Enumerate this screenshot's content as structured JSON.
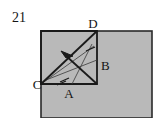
{
  "figure": {
    "problem_number": "21",
    "canvas": {
      "width": 162,
      "height": 118,
      "background": "#ffffff"
    },
    "colors": {
      "shaded_fill": "#b9b9b9",
      "outline": "#2a2a2a",
      "line": "#1a1a1a",
      "thin_line": "#3a3a3a",
      "text": "#141414"
    },
    "shaded_rectangle": {
      "name": "large-shaded-rectangle",
      "x": 41,
      "y": 31,
      "width": 111,
      "height": 87,
      "fill": "#b9b9b9",
      "stroke": "#2a2a2a",
      "stroke_width": 1.6
    },
    "square": {
      "name": "inner-square-CABD",
      "corners": {
        "C": {
          "x": 41,
          "y": 84
        },
        "bottom_right": {
          "x": 97,
          "y": 84
        },
        "D": {
          "x": 97,
          "y": 31
        },
        "top_left": {
          "x": 41,
          "y": 31
        }
      },
      "stroke": "#1a1a1a",
      "stroke_width": 1.8
    },
    "diagonal": {
      "name": "diagonal-C-to-D",
      "from": {
        "x": 41,
        "y": 84
      },
      "to": {
        "x": 97,
        "y": 31
      },
      "stroke_width": 1.8
    },
    "arrow": {
      "name": "arrow-vector-up-left",
      "from": {
        "x": 97,
        "y": 84
      },
      "to": {
        "x": 62,
        "y": 52
      },
      "head_length": 9,
      "head_width": 7,
      "stroke_width": 1.8
    },
    "thin_lines": [
      {
        "name": "thin-line-1",
        "from": {
          "x": 41,
          "y": 84
        },
        "to": {
          "x": 94,
          "y": 46
        },
        "stroke_width": 0.8
      },
      {
        "name": "thin-line-2",
        "from": {
          "x": 46,
          "y": 80
        },
        "to": {
          "x": 97,
          "y": 60
        },
        "stroke_width": 0.8
      },
      {
        "name": "thin-line-3",
        "from": {
          "x": 72,
          "y": 84
        },
        "to": {
          "x": 92,
          "y": 44
        },
        "stroke_width": 0.8
      }
    ],
    "tick_marks": [
      {
        "name": "tick-mark-on-CA",
        "from": {
          "x": 60,
          "y": 81
        },
        "to": {
          "x": 68,
          "y": 78
        }
      },
      {
        "name": "tick-mark-on-diagonal",
        "from": {
          "x": 86,
          "y": 50
        },
        "to": {
          "x": 94,
          "y": 47
        }
      },
      {
        "name": "tick-mark-lower",
        "from": {
          "x": 58,
          "y": 83
        },
        "to": {
          "x": 66,
          "y": 80
        }
      }
    ],
    "labels": [
      {
        "name": "vertex-label-D",
        "text": "D",
        "x": 93,
        "y": 28,
        "anchor": "middle"
      },
      {
        "name": "vertex-label-B",
        "text": "B",
        "x": 102,
        "y": 70,
        "anchor": "start"
      },
      {
        "name": "vertex-label-C",
        "text": "C",
        "x": 37,
        "y": 88,
        "anchor": "middle"
      },
      {
        "name": "vertex-label-A",
        "text": "A",
        "x": 69,
        "y": 97,
        "anchor": "middle"
      }
    ]
  }
}
